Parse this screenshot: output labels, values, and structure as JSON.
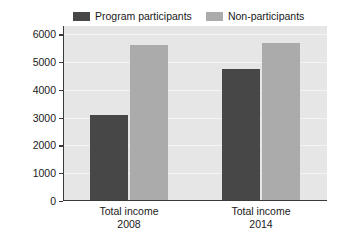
{
  "chart_data": {
    "type": "bar",
    "title": "",
    "xlabel": "",
    "ylabel": "U.S. dollars/household",
    "categories": [
      "Total income\n2008",
      "Total income\n2014"
    ],
    "category_lines": [
      {
        "line1": "Total income",
        "line2": "2008"
      },
      {
        "line1": "Total income",
        "line2": "2014"
      }
    ],
    "series": [
      {
        "name": "Program participants",
        "color": "#474747",
        "values": [
          3100,
          4750
        ]
      },
      {
        "name": "Non-participants",
        "color": "#ababab",
        "values": [
          5600,
          5700
        ]
      }
    ],
    "ylim": [
      0,
      6300
    ],
    "yticks": [
      0,
      1000,
      2000,
      3000,
      4000,
      5000,
      6000
    ],
    "ytick_labels": [
      "0",
      "1000",
      "2000",
      "3000",
      "4000",
      "5000",
      "6000"
    ],
    "grid": true,
    "grid_color": "#f4f4f4",
    "legend_position": "top",
    "plot_background": "#e6e6e6",
    "figure_background": "#ffffff",
    "axis_color": "#3a3a3a"
  },
  "legend": {
    "entries": [
      {
        "label": "Program participants",
        "color": "#474747"
      },
      {
        "label": "Non-participants",
        "color": "#ababab"
      }
    ]
  },
  "axes": {
    "y_title": "U.S. dollars/household",
    "y_tick_labels": [
      "6000",
      "5000",
      "4000",
      "3000",
      "2000",
      "1000",
      "0"
    ],
    "x_groups": [
      {
        "line1": "Total income",
        "line2": "2008"
      },
      {
        "line1": "Total income",
        "line2": "2014"
      }
    ]
  }
}
